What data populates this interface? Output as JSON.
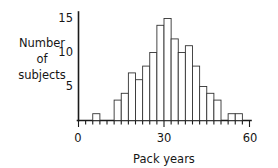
{
  "chart_data": {
    "type": "bar",
    "title": "",
    "subtitle": "",
    "xlabel": "Pack years",
    "ylabel": "Number of subjects",
    "ylabel_lines": [
      "Number",
      "of",
      "subjects"
    ],
    "xlim": [
      0,
      60
    ],
    "ylim": [
      0,
      16
    ],
    "grid": false,
    "legend": null,
    "bin_width": 2.5,
    "x_tick_labels": [
      "0",
      "30",
      "60"
    ],
    "x_tick_values": [
      0,
      30,
      60
    ],
    "y_tick_labels": [
      "5",
      "10",
      "15"
    ],
    "y_tick_values": [
      5,
      10,
      15
    ],
    "x_minor_ticks": [
      2.5,
      5,
      7.5,
      10,
      12.5,
      15,
      17.5,
      20,
      22.5,
      25,
      27.5,
      32.5,
      35,
      37.5,
      40,
      42.5,
      45,
      47.5,
      50,
      52.5,
      55,
      57.5
    ],
    "categories": [
      5,
      7.5,
      10,
      12.5,
      15,
      17.5,
      20,
      22.5,
      25,
      27.5,
      30,
      32.5,
      35,
      37.5,
      40,
      42.5,
      45,
      47.5,
      50,
      52.5,
      55
    ],
    "values": [
      1,
      0,
      0,
      3,
      4,
      7,
      6,
      8,
      10,
      14,
      15,
      12,
      10,
      11,
      8,
      5,
      4,
      3,
      0,
      1,
      1
    ],
    "bars": [
      {
        "bin_start": 5,
        "bin_end": 7.5,
        "count": 1
      },
      {
        "bin_start": 7.5,
        "bin_end": 10,
        "count": 0
      },
      {
        "bin_start": 10,
        "bin_end": 12.5,
        "count": 0
      },
      {
        "bin_start": 12.5,
        "bin_end": 15,
        "count": 3
      },
      {
        "bin_start": 15,
        "bin_end": 17.5,
        "count": 4
      },
      {
        "bin_start": 17.5,
        "bin_end": 20,
        "count": 7
      },
      {
        "bin_start": 20,
        "bin_end": 22.5,
        "count": 6
      },
      {
        "bin_start": 22.5,
        "bin_end": 25,
        "count": 8
      },
      {
        "bin_start": 25,
        "bin_end": 27.5,
        "count": 10
      },
      {
        "bin_start": 27.5,
        "bin_end": 30,
        "count": 14
      },
      {
        "bin_start": 30,
        "bin_end": 32.5,
        "count": 15
      },
      {
        "bin_start": 32.5,
        "bin_end": 35,
        "count": 12
      },
      {
        "bin_start": 35,
        "bin_end": 37.5,
        "count": 10
      },
      {
        "bin_start": 37.5,
        "bin_end": 40,
        "count": 11
      },
      {
        "bin_start": 40,
        "bin_end": 42.5,
        "count": 8
      },
      {
        "bin_start": 42.5,
        "bin_end": 45,
        "count": 5
      },
      {
        "bin_start": 45,
        "bin_end": 47.5,
        "count": 4
      },
      {
        "bin_start": 47.5,
        "bin_end": 50,
        "count": 3
      },
      {
        "bin_start": 50,
        "bin_end": 52.5,
        "count": 0
      },
      {
        "bin_start": 52.5,
        "bin_end": 55,
        "count": 1
      },
      {
        "bin_start": 55,
        "bin_end": 57.5,
        "count": 1
      }
    ],
    "colors": {
      "bar_fill": "#ffffff",
      "bar_stroke": "#333333",
      "axis": "#1a1a1a",
      "text": "#161616",
      "background": "#ffffff"
    }
  }
}
